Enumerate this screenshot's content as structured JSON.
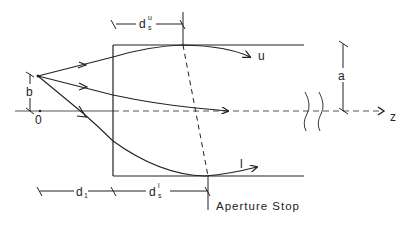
{
  "diagram": {
    "colors": {
      "stroke": "#222222",
      "axis": "#555555",
      "background": "#ffffff"
    },
    "labels": {
      "ds_top_main": "d",
      "ds_top_sub": "s",
      "ds_top_sup": "u",
      "ds_bottom_main": "d",
      "ds_bottom_sub": "s",
      "ds_bottom_sup": "l",
      "d1_main": "d",
      "d1_sub": "1",
      "b": "b",
      "origin": "0",
      "a": "a",
      "z": "z",
      "ray_upper": "u",
      "ray_lower": "l",
      "aperture_stop": "Aperture Stop"
    },
    "elements": [
      "optical axis (z)",
      "source point at height b",
      "tube of radius a",
      "aperture stop (dashed tilted line)",
      "upper ray u",
      "chief ray",
      "lower ray l",
      "dimension d_1",
      "dimension d_s^u",
      "dimension d_s^l",
      "axis break marks"
    ]
  }
}
